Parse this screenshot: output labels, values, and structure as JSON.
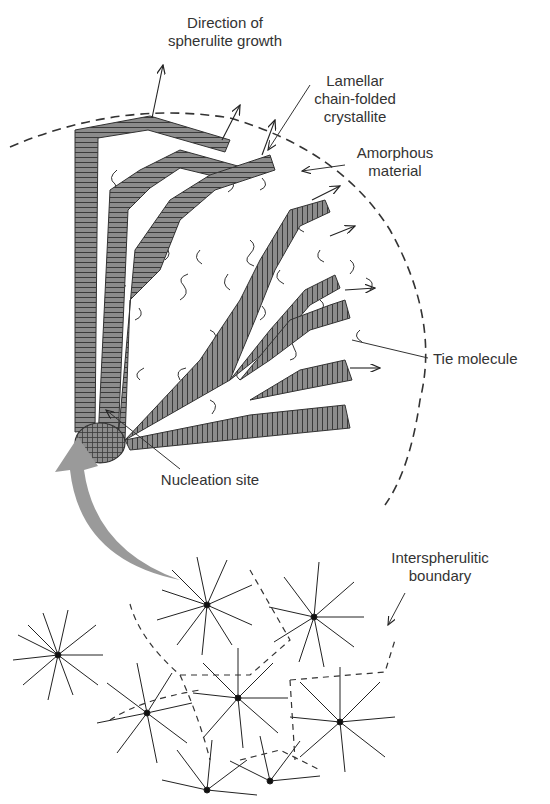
{
  "figure": {
    "colors": {
      "lamella_fill": "#8c8c8c",
      "lamella_stripe": "#3a3a3a",
      "amorphous_line": "#333333",
      "arrow_gray": "#9a9a9a",
      "label_text": "#333333",
      "background": "#ffffff"
    }
  },
  "labels": {
    "growth_direction": {
      "line1": "Direction of",
      "line2": "spherulite growth"
    },
    "lamellar": {
      "line1": "Lamellar",
      "line2": "chain-folded",
      "line3": "crystallite"
    },
    "amorphous": {
      "line1": "Amorphous",
      "line2": "material"
    },
    "tie_molecule": {
      "line1": "Tie molecule"
    },
    "nucleation": {
      "line1": "Nucleation site"
    },
    "interspherulitic": {
      "line1": "Interspherulitic",
      "line2": "boundary"
    }
  }
}
